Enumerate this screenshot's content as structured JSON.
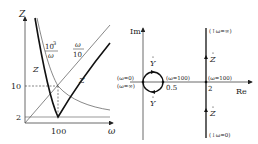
{
  "left_plot": {
    "y_axis_label": "Z",
    "x_axis_label": "ω",
    "y_ticks": [
      "10",
      "2"
    ],
    "x_ticks": [
      "100"
    ],
    "curve_labels": {
      "inverse": {
        "num": "10",
        "sup": "3",
        "den": "ω"
      },
      "linear": {
        "num": "ω",
        "den": "10"
      },
      "z_left": "Z",
      "z_right": "Z"
    }
  },
  "right_plot": {
    "im_label": "Im",
    "re_label": "Re",
    "circle": {
      "top_label": "Y",
      "bottom_label": "Y",
      "left_top": "(ω=0)",
      "left_bottom": "(ω=∞)",
      "right_top": "(ω=100)",
      "right_bottom": "0.5"
    },
    "line": {
      "top": "(↑ω=∞)",
      "upper_label": "Z",
      "mid_top": "(ω=100)",
      "mid_bottom": "2",
      "lower_label": "Z",
      "bottom": "(↓ω=0)"
    }
  },
  "colors": {
    "stroke": "#222222",
    "thin": "#444444"
  }
}
